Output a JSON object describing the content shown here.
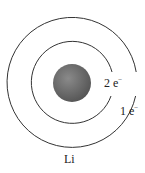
{
  "diagram": {
    "element_symbol": "Li",
    "nucleus_color": "#6e6e6e",
    "shells": [
      {
        "label_count": "2 e",
        "label_sup": "−",
        "radius": 41
      },
      {
        "label_count": "1 e",
        "label_sup": "−",
        "radius": 65
      }
    ]
  }
}
